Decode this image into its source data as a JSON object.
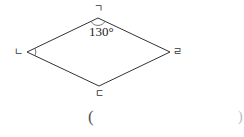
{
  "diagram": {
    "shape": "rhombus",
    "vertices": [
      {
        "id": "top",
        "label": "ㄱ",
        "x": 98,
        "y": 18
      },
      {
        "id": "left",
        "label": "ㄴ",
        "x": 27,
        "y": 52
      },
      {
        "id": "bottom",
        "label": "ㄷ",
        "x": 99,
        "y": 86
      },
      {
        "id": "right",
        "label": "ㄹ",
        "x": 170,
        "y": 52
      }
    ],
    "angles": [
      {
        "vertex": "ㄱ",
        "value": "130°",
        "marked": true
      },
      {
        "vertex": "ㄴ",
        "value": "",
        "marked": true
      }
    ],
    "stroke_color": "#333333"
  },
  "answer": {
    "open_paren": "(",
    "close_paren": ")",
    "value": ""
  }
}
